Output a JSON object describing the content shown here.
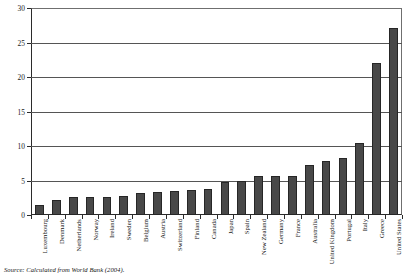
{
  "chart_data": {
    "type": "bar",
    "title": "",
    "xlabel": "",
    "ylabel": "",
    "ylim": [
      0,
      30
    ],
    "yticks": [
      0,
      5,
      10,
      15,
      20,
      25,
      30
    ],
    "grid": true,
    "legend": false,
    "categories": [
      "Luxembourg",
      "Denmark",
      "Netherlands",
      "Norway",
      "Ireland",
      "Sweden",
      "Belgium",
      "Austria",
      "Switzerland",
      "Finland",
      "Canada",
      "Japan",
      "Spain",
      "New Zealand",
      "Germany",
      "France",
      "Australia",
      "United Kingdom",
      "Portugal",
      "Italy",
      "Greece",
      "United States"
    ],
    "values": [
      1.5,
      2.2,
      2.6,
      2.6,
      2.6,
      2.8,
      3.2,
      3.3,
      3.5,
      3.6,
      3.8,
      4.8,
      5.0,
      5.6,
      5.6,
      5.7,
      7.2,
      7.8,
      8.2,
      10.4,
      22.0,
      27.1
    ],
    "bar_color": "#484848",
    "bar_edge_color": "#262626",
    "gridline_color": "#555555",
    "axis_color": "#2b2b2b"
  },
  "source_note": "Source: Calculated from World Bank (2004)."
}
